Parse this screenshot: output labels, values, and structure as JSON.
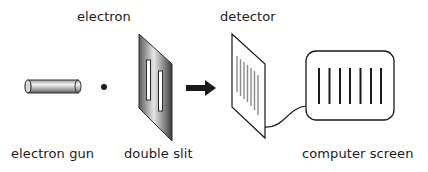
{
  "labels": {
    "electron": "electron",
    "detector": "detector",
    "electron_gun": "electron gun",
    "double_slit": "double slit",
    "computer_screen": "computer screen"
  },
  "components": [
    {
      "name": "electron gun",
      "shape": "horizontal metallic cylinder"
    },
    {
      "name": "electron",
      "shape": "small black dot"
    },
    {
      "name": "double slit",
      "shape": "slanted gray plate with two vertical slits"
    },
    {
      "name": "arrow",
      "shape": "thick black right-pointing arrow"
    },
    {
      "name": "detector",
      "shape": "slanted white plate with 7 gray vertical fringe lines"
    },
    {
      "name": "cable",
      "shape": "curved line connecting detector to screen"
    },
    {
      "name": "computer screen",
      "shape": "rounded rectangle with 7 black vertical lines"
    }
  ],
  "detector_fringe_count": 7,
  "screen_line_count": 7,
  "colors": {
    "ink": "#1a1a1a",
    "fringe_gray": "#888888",
    "plate_dark": "#555555",
    "plate_light": "#e8e8e8"
  }
}
